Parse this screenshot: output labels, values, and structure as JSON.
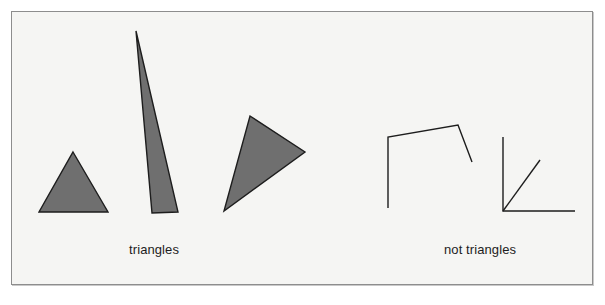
{
  "figure": {
    "frame": {
      "x": 11,
      "y": 11,
      "width": 582,
      "height": 274,
      "border_color": "#8d8d8d",
      "background_color": "#f5f5f3"
    },
    "colors": {
      "page_background": "#ffffff",
      "shape_fill": "#6f6f6f",
      "shape_stroke": "#1d1d1d",
      "line_stroke": "#1d1d1d",
      "text": "#1d1d1d"
    },
    "labels": [
      {
        "name": "triangles-label",
        "text": "triangles",
        "x": 129,
        "y": 243
      },
      {
        "name": "not-triangles-label",
        "text": "not triangles",
        "x": 444,
        "y": 243
      }
    ],
    "shapes": {
      "triangles": [
        {
          "name": "equilateral-triangle",
          "points": "73,152 108,212 39,212",
          "fill": "#6f6f6f",
          "stroke": "#1d1d1d",
          "stroke_width": 1.4
        },
        {
          "name": "sliver-triangle",
          "points": "136,31 178,212 152,213",
          "fill": "#6f6f6f",
          "stroke": "#1d1d1d",
          "stroke_width": 1.4
        },
        {
          "name": "rotated-scalene-triangle",
          "points": "250,116 305,152 224,211",
          "fill": "#6f6f6f",
          "stroke": "#1d1d1d",
          "stroke_width": 1.4
        }
      ],
      "not_triangles": [
        {
          "name": "open-quadrilateral-polyline",
          "points": "388,208 388,137 458,125 472,162",
          "stroke": "#1d1d1d",
          "stroke_width": 1.4
        },
        {
          "name": "right-angle-with-ray",
          "corner_path": "503,137 503,211 575,211",
          "ray_path": "503,211 540,160",
          "stroke": "#1d1d1d",
          "stroke_width": 1.4
        }
      ]
    }
  }
}
